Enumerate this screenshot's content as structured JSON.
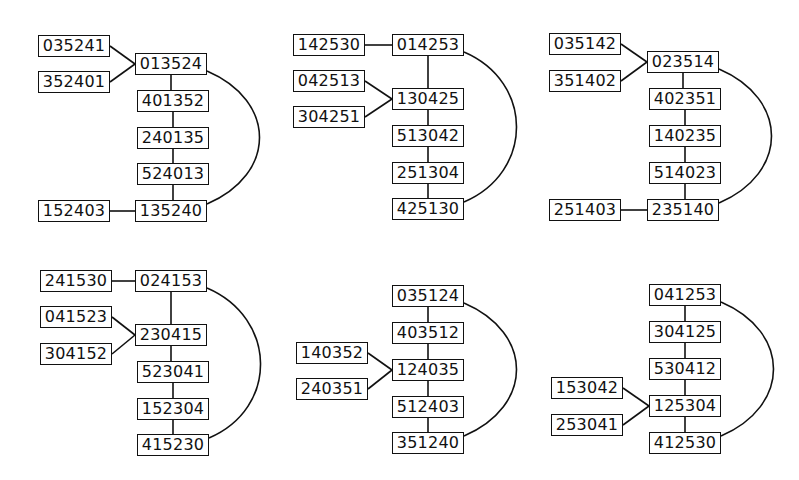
{
  "diagrams": [
    {
      "id": "d1",
      "nodes": [
        {
          "label": "035241",
          "x": 38,
          "y": 35
        },
        {
          "label": "352401",
          "x": 38,
          "y": 71
        },
        {
          "label": "013524",
          "x": 135,
          "y": 53
        },
        {
          "label": "401352",
          "x": 137,
          "y": 90
        },
        {
          "label": "240135",
          "x": 137,
          "y": 127
        },
        {
          "label": "524013",
          "x": 137,
          "y": 163
        },
        {
          "label": "135240",
          "x": 135,
          "y": 200
        },
        {
          "label": "152403",
          "x": 38,
          "y": 200
        }
      ],
      "edges": [
        [
          0,
          2
        ],
        [
          1,
          2
        ],
        [
          2,
          3
        ],
        [
          3,
          4
        ],
        [
          4,
          5
        ],
        [
          5,
          6
        ],
        [
          7,
          6
        ]
      ],
      "arc": [
        2,
        6
      ]
    },
    {
      "id": "d2",
      "nodes": [
        {
          "label": "142530",
          "x": 293,
          "y": 34
        },
        {
          "label": "014253",
          "x": 392,
          "y": 34
        },
        {
          "label": "042513",
          "x": 293,
          "y": 70
        },
        {
          "label": "304251",
          "x": 293,
          "y": 106
        },
        {
          "label": "130425",
          "x": 392,
          "y": 88
        },
        {
          "label": "513042",
          "x": 392,
          "y": 125
        },
        {
          "label": "251304",
          "x": 392,
          "y": 162
        },
        {
          "label": "425130",
          "x": 392,
          "y": 198
        }
      ],
      "edges": [
        [
          0,
          1
        ],
        [
          1,
          4
        ],
        [
          2,
          4
        ],
        [
          3,
          4
        ],
        [
          4,
          5
        ],
        [
          5,
          6
        ],
        [
          6,
          7
        ]
      ],
      "arc": [
        1,
        7
      ]
    },
    {
      "id": "d3",
      "nodes": [
        {
          "label": "035142",
          "x": 549,
          "y": 33
        },
        {
          "label": "351402",
          "x": 549,
          "y": 70
        },
        {
          "label": "023514",
          "x": 647,
          "y": 51
        },
        {
          "label": "402351",
          "x": 649,
          "y": 88
        },
        {
          "label": "140235",
          "x": 649,
          "y": 125
        },
        {
          "label": "514023",
          "x": 649,
          "y": 162
        },
        {
          "label": "235140",
          "x": 647,
          "y": 199
        },
        {
          "label": "251403",
          "x": 549,
          "y": 199
        }
      ],
      "edges": [
        [
          0,
          2
        ],
        [
          1,
          2
        ],
        [
          2,
          3
        ],
        [
          3,
          4
        ],
        [
          4,
          5
        ],
        [
          5,
          6
        ],
        [
          7,
          6
        ]
      ],
      "arc": [
        2,
        6
      ]
    },
    {
      "id": "d4",
      "nodes": [
        {
          "label": "241530",
          "x": 40,
          "y": 270
        },
        {
          "label": "024153",
          "x": 135,
          "y": 270
        },
        {
          "label": "041523",
          "x": 40,
          "y": 306
        },
        {
          "label": "304152",
          "x": 40,
          "y": 343
        },
        {
          "label": "230415",
          "x": 135,
          "y": 324
        },
        {
          "label": "523041",
          "x": 137,
          "y": 361
        },
        {
          "label": "152304",
          "x": 137,
          "y": 398
        },
        {
          "label": "415230",
          "x": 137,
          "y": 434
        }
      ],
      "edges": [
        [
          0,
          1
        ],
        [
          1,
          4
        ],
        [
          2,
          4
        ],
        [
          3,
          4
        ],
        [
          4,
          5
        ],
        [
          5,
          6
        ],
        [
          6,
          7
        ]
      ],
      "arc": [
        1,
        7
      ]
    },
    {
      "id": "d5",
      "nodes": [
        {
          "label": "035124",
          "x": 392,
          "y": 285
        },
        {
          "label": "403512",
          "x": 392,
          "y": 322
        },
        {
          "label": "140352",
          "x": 296,
          "y": 342
        },
        {
          "label": "240351",
          "x": 296,
          "y": 378
        },
        {
          "label": "124035",
          "x": 392,
          "y": 359
        },
        {
          "label": "512403",
          "x": 392,
          "y": 396
        },
        {
          "label": "351240",
          "x": 392,
          "y": 432
        }
      ],
      "edges": [
        [
          0,
          1
        ],
        [
          1,
          4
        ],
        [
          2,
          4
        ],
        [
          3,
          4
        ],
        [
          4,
          5
        ],
        [
          5,
          6
        ]
      ],
      "arc": [
        0,
        6
      ]
    },
    {
      "id": "d6",
      "nodes": [
        {
          "label": "041253",
          "x": 649,
          "y": 284
        },
        {
          "label": "304125",
          "x": 649,
          "y": 321
        },
        {
          "label": "530412",
          "x": 649,
          "y": 358
        },
        {
          "label": "153042",
          "x": 551,
          "y": 377
        },
        {
          "label": "253041",
          "x": 551,
          "y": 414
        },
        {
          "label": "125304",
          "x": 649,
          "y": 395
        },
        {
          "label": "412530",
          "x": 649,
          "y": 432
        }
      ],
      "edges": [
        [
          0,
          1
        ],
        [
          1,
          2
        ],
        [
          2,
          5
        ],
        [
          3,
          5
        ],
        [
          4,
          5
        ],
        [
          5,
          6
        ]
      ],
      "arc": [
        0,
        6
      ]
    }
  ],
  "style": {
    "stroke": "#111111",
    "background": "#ffffff"
  }
}
